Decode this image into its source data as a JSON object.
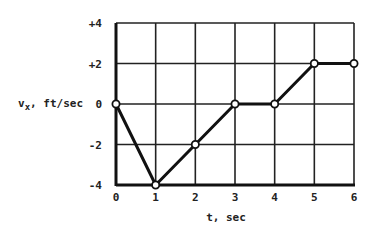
{
  "chart_data": {
    "type": "line",
    "title": "",
    "xlabel": "t, sec",
    "ylabel": "v_x, ft/sec",
    "ylabel_main": "v",
    "ylabel_sub": "x",
    "ylabel_rest": ", ft/sec",
    "x": [
      0,
      1,
      2,
      3,
      4,
      5,
      6
    ],
    "series": [
      {
        "name": "v_x",
        "values": [
          0,
          -4,
          -2,
          0,
          0,
          2,
          2
        ]
      }
    ],
    "xlim": [
      0,
      6
    ],
    "ylim": [
      -4,
      4
    ],
    "x_ticks": [
      "0",
      "1",
      "2",
      "3",
      "4",
      "5",
      "6"
    ],
    "y_ticks": [
      "+4",
      "+2",
      "0",
      "-2",
      "-4"
    ],
    "y_tick_values": [
      4,
      2,
      0,
      -2,
      -4
    ],
    "grid": true,
    "markers": "open-circle",
    "line_color": "#111111",
    "grid_color": "#222222"
  }
}
